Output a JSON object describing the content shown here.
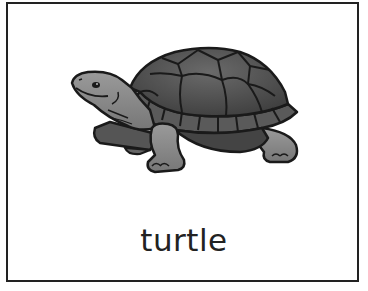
{
  "card": {
    "word": "turtle",
    "image_subject": "turtle",
    "border_color": "#222222",
    "background_color": "#ffffff"
  },
  "colors": {
    "shell_dark": "#4a4a4a",
    "shell_mid": "#5e5e5e",
    "skin": "#8a8a8a",
    "outline": "#1a1a1a"
  }
}
